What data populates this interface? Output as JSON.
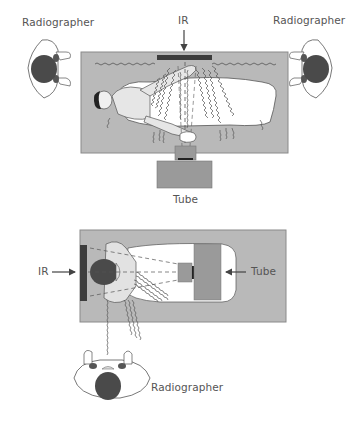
{
  "figure": {
    "top_view": {
      "labels": {
        "radiographer_left": "Radiographer",
        "radiographer_right": "Radiographer",
        "ir": "IR",
        "tube": "Tube"
      }
    },
    "bottom_view": {
      "labels": {
        "ir": "IR",
        "tube": "Tube",
        "radiographer": "Radiographer"
      }
    },
    "colors": {
      "table": "#b9b9b9",
      "table_border": "#8a8a8a",
      "ir_bar": "#3d3d3d",
      "tube_housing": "#9a9a9a",
      "head": "#4a4a4a",
      "body_fill": "#ffffff",
      "line": "#555555"
    }
  }
}
